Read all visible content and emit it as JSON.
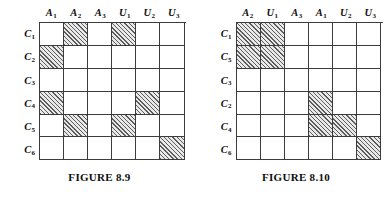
{
  "figures": [
    {
      "caption": "FIGURE 8.9",
      "columns": [
        {
          "base": "A",
          "sub": "1"
        },
        {
          "base": "A",
          "sub": "2"
        },
        {
          "base": "A",
          "sub": "3"
        },
        {
          "base": "U",
          "sub": "1"
        },
        {
          "base": "U",
          "sub": "2"
        },
        {
          "base": "U",
          "sub": "3"
        }
      ],
      "rows": [
        {
          "base": "C",
          "sub": "1"
        },
        {
          "base": "C",
          "sub": "2"
        },
        {
          "base": "C",
          "sub": "3"
        },
        {
          "base": "C",
          "sub": "4"
        },
        {
          "base": "C",
          "sub": "5"
        },
        {
          "base": "C",
          "sub": "6"
        }
      ],
      "matrix": [
        [
          0,
          1,
          0,
          1,
          0,
          0
        ],
        [
          1,
          0,
          0,
          0,
          0,
          0
        ],
        [
          0,
          0,
          0,
          0,
          0,
          0
        ],
        [
          1,
          0,
          0,
          0,
          1,
          0
        ],
        [
          0,
          1,
          0,
          1,
          0,
          0
        ],
        [
          0,
          0,
          0,
          0,
          0,
          1
        ]
      ]
    },
    {
      "caption": "FIGURE 8.10",
      "columns": [
        {
          "base": "A",
          "sub": "2"
        },
        {
          "base": "U",
          "sub": "1"
        },
        {
          "base": "A",
          "sub": "3"
        },
        {
          "base": "A",
          "sub": "1"
        },
        {
          "base": "U",
          "sub": "2"
        },
        {
          "base": "U",
          "sub": "3"
        }
      ],
      "rows": [
        {
          "base": "C",
          "sub": "1"
        },
        {
          "base": "C",
          "sub": "5"
        },
        {
          "base": "C",
          "sub": "3"
        },
        {
          "base": "C",
          "sub": "2"
        },
        {
          "base": "C",
          "sub": "4"
        },
        {
          "base": "C",
          "sub": "6"
        }
      ],
      "matrix": [
        [
          1,
          1,
          0,
          0,
          0,
          0
        ],
        [
          1,
          1,
          0,
          0,
          0,
          0
        ],
        [
          0,
          0,
          0,
          0,
          0,
          0
        ],
        [
          0,
          0,
          0,
          1,
          0,
          0
        ],
        [
          0,
          0,
          0,
          1,
          1,
          0
        ],
        [
          0,
          0,
          0,
          0,
          0,
          1
        ]
      ]
    }
  ],
  "colors": {
    "grid_line": "#3b3b3b",
    "hatch": "#5c5c5c",
    "shaded_fill": "#e9e9e9",
    "background": "#ffffff",
    "text": "#111111"
  }
}
